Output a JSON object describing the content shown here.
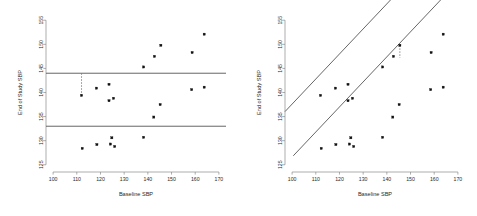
{
  "figure": {
    "panels": [
      {
        "id": "left",
        "name": "horizontal-reference-panel",
        "xlabel": "Baseline SBP",
        "ylabel": "End of Study SBP"
      },
      {
        "id": "right",
        "name": "regression-lines-panel",
        "xlabel": "Baseline SBP",
        "ylabel": "End of Study SBP"
      }
    ]
  },
  "chart_data": [
    {
      "type": "scatter",
      "panel": "left",
      "title": "",
      "xlabel": "Baseline SBP",
      "ylabel": "End of Study SBP",
      "xlim": [
        97,
        173
      ],
      "ylim": [
        123.5,
        156.5
      ],
      "xticks": [
        100,
        110,
        120,
        130,
        140,
        150,
        160,
        170
      ],
      "yticks": [
        125,
        130,
        135,
        140,
        145,
        150,
        155
      ],
      "xticklabels": [
        "100",
        "110",
        "120",
        "130",
        "140",
        "150",
        "160",
        "170"
      ],
      "yticklabels": [
        "125",
        "130",
        "135",
        "140",
        "145",
        "150",
        "155"
      ],
      "grid": false,
      "legend": false,
      "series": [
        {
          "name": "subjects",
          "marker": "square",
          "color": "#111111",
          "points": [
            [
              112.0,
              139.4
            ],
            [
              118.3,
              140.9
            ],
            [
              123.6,
              141.7
            ],
            [
              123.6,
              138.3
            ],
            [
              125.5,
              138.8
            ],
            [
              138.2,
              145.3
            ],
            [
              142.8,
              147.5
            ],
            [
              145.5,
              149.8
            ],
            [
              158.7,
              148.3
            ],
            [
              163.8,
              152.1
            ],
            [
              158.5,
              140.6
            ],
            [
              163.8,
              141.1
            ],
            [
              145.2,
              137.5
            ],
            [
              142.5,
              134.9
            ],
            [
              138.2,
              130.7
            ],
            [
              124.8,
              130.6
            ],
            [
              124.2,
              129.3
            ],
            [
              126.0,
              128.8
            ],
            [
              118.5,
              129.2
            ],
            [
              112.3,
              128.4
            ]
          ]
        }
      ],
      "reference_lines": [
        {
          "name": "upper-horizontal-line",
          "orientation": "horizontal",
          "y": 144.0
        },
        {
          "name": "lower-horizontal-line",
          "orientation": "horizontal",
          "y": 133.0
        }
      ],
      "annotations": [
        {
          "name": "residual-dashed-segment",
          "style": "dashed-vertical",
          "x": 112.0,
          "y_from": 144.0,
          "y_to": 139.4
        }
      ]
    },
    {
      "type": "scatter",
      "panel": "right",
      "title": "",
      "xlabel": "Baseline SBP",
      "ylabel": "End of Study SBP",
      "xlim": [
        97,
        173
      ],
      "ylim": [
        123.5,
        156.5
      ],
      "xticks": [
        100,
        110,
        120,
        130,
        140,
        150,
        160,
        170
      ],
      "yticks": [
        125,
        130,
        135,
        140,
        145,
        150,
        155
      ],
      "xticklabels": [
        "100",
        "110",
        "120",
        "130",
        "140",
        "150",
        "160",
        "170"
      ],
      "yticklabels": [
        "125",
        "130",
        "135",
        "140",
        "145",
        "150",
        "155"
      ],
      "grid": false,
      "legend": false,
      "series": [
        {
          "name": "subjects",
          "marker": "square",
          "color": "#111111",
          "points": [
            [
              112.0,
              139.4
            ],
            [
              118.3,
              140.9
            ],
            [
              123.6,
              141.7
            ],
            [
              123.6,
              138.3
            ],
            [
              125.5,
              138.8
            ],
            [
              138.2,
              145.3
            ],
            [
              142.8,
              147.5
            ],
            [
              145.5,
              149.8
            ],
            [
              158.7,
              148.3
            ],
            [
              163.8,
              152.1
            ],
            [
              158.5,
              140.6
            ],
            [
              163.8,
              141.1
            ],
            [
              145.2,
              137.5
            ],
            [
              142.5,
              134.9
            ],
            [
              138.2,
              130.7
            ],
            [
              124.8,
              130.6
            ],
            [
              124.2,
              129.3
            ],
            [
              126.0,
              128.8
            ],
            [
              118.5,
              129.2
            ],
            [
              112.3,
              128.4
            ]
          ]
        }
      ],
      "reference_lines": [
        {
          "name": "upper-regression-line",
          "orientation": "diagonal",
          "slope": 0.52,
          "intercept": 85.6,
          "x_from": 97,
          "x_to": 170.5
        },
        {
          "name": "lower-regression-line",
          "orientation": "diagonal",
          "slope": 0.52,
          "intercept": 74.6,
          "x_from": 100.5,
          "x_to": 173
        }
      ],
      "annotations": [
        {
          "name": "residual-dashed-segment",
          "style": "dashed-vertical",
          "x": 145.5,
          "y_from": 149.8,
          "y_to": 147.2
        }
      ]
    }
  ]
}
